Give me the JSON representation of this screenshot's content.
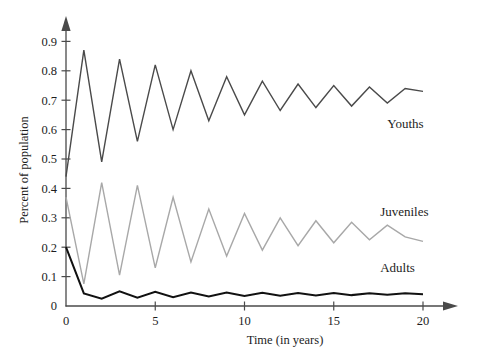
{
  "chart_data": {
    "type": "line",
    "title": "",
    "xlabel": "Time (in years)",
    "ylabel": "Percent of population",
    "xlim": [
      0,
      20
    ],
    "ylim": [
      0,
      0.95
    ],
    "grid": false,
    "legend_position": "inline-right",
    "x_ticks": [
      "0",
      "5",
      "10",
      "15",
      "20"
    ],
    "x_tick_values": [
      0,
      5,
      10,
      15,
      20
    ],
    "y_ticks": [
      "0",
      "0.1",
      "0.2",
      "0.3",
      "0.4",
      "0.5",
      "0.6",
      "0.7",
      "0.8",
      "0.9"
    ],
    "y_tick_values": [
      0,
      0.1,
      0.2,
      0.3,
      0.4,
      0.5,
      0.6,
      0.7,
      0.8,
      0.9
    ],
    "x": [
      0,
      1,
      2,
      3,
      4,
      5,
      6,
      7,
      8,
      9,
      10,
      11,
      12,
      13,
      14,
      15,
      16,
      17,
      18,
      19,
      20
    ],
    "series": [
      {
        "name": "Youths",
        "color": "#4a4a4a",
        "width": 1.4,
        "label_x": 18.0,
        "label_y": 0.605,
        "values": [
          0.44,
          0.87,
          0.49,
          0.84,
          0.56,
          0.82,
          0.6,
          0.8,
          0.63,
          0.78,
          0.65,
          0.765,
          0.665,
          0.755,
          0.675,
          0.75,
          0.68,
          0.745,
          0.69,
          0.74,
          0.73
        ]
      },
      {
        "name": "Juveniles",
        "color": "#a8a8a8",
        "width": 1.4,
        "label_x": 17.6,
        "label_y": 0.305,
        "values": [
          0.37,
          0.075,
          0.42,
          0.105,
          0.41,
          0.13,
          0.37,
          0.15,
          0.33,
          0.17,
          0.315,
          0.19,
          0.3,
          0.205,
          0.29,
          0.215,
          0.285,
          0.225,
          0.275,
          0.235,
          0.22
        ]
      },
      {
        "name": "Adults",
        "color": "#111111",
        "width": 2.0,
        "label_x": 17.6,
        "label_y": 0.115,
        "values": [
          0.2,
          0.043,
          0.025,
          0.05,
          0.028,
          0.048,
          0.03,
          0.046,
          0.032,
          0.046,
          0.034,
          0.045,
          0.035,
          0.044,
          0.036,
          0.044,
          0.037,
          0.043,
          0.038,
          0.043,
          0.04
        ]
      }
    ]
  },
  "figure": {
    "axis_color": "#4a4a4a",
    "background": "#ffffff"
  }
}
